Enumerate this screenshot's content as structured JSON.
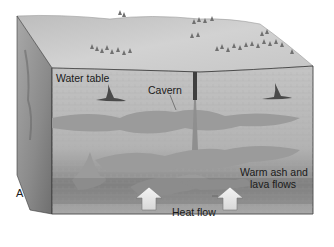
{
  "figure": {
    "panel_label": "A",
    "labels": {
      "water_table": "Water table",
      "cavern": "Cavern",
      "warm_ash_line1": "Warm ash and",
      "warm_ash_line2": "lava flows",
      "heat_flow": "Heat flow"
    },
    "colors": {
      "surface": "#c9c9c9",
      "block_face": "#b8b8b8",
      "side_face": "#8f8f8f",
      "cavern_fill": "#9a9a9a",
      "deep_shadow": "#6e6e6e",
      "edge": "#3a3a3a",
      "arrow_fill": "#e6e6e6",
      "tree": "#6f6f6f"
    }
  }
}
